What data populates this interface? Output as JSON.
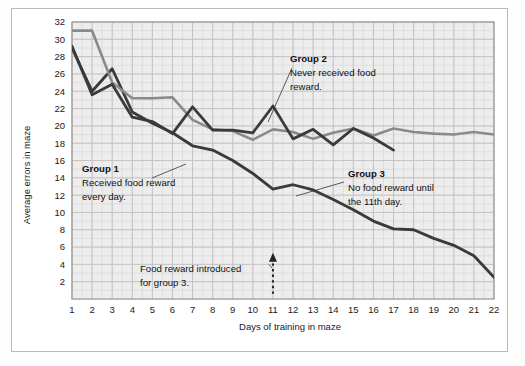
{
  "chart_data": {
    "type": "line",
    "title": "",
    "xlabel": "Days of training in maze",
    "ylabel": "Average errors in maze",
    "xlim": [
      1,
      22
    ],
    "ylim": [
      0,
      32
    ],
    "xticks": [
      1,
      2,
      3,
      4,
      5,
      6,
      7,
      8,
      9,
      10,
      11,
      12,
      13,
      14,
      15,
      16,
      17,
      18,
      19,
      20,
      21,
      22
    ],
    "yticks": [
      2,
      4,
      6,
      8,
      10,
      12,
      14,
      16,
      18,
      20,
      22,
      24,
      26,
      28,
      30,
      32
    ],
    "grid": true,
    "legend_position": "inline-annotations",
    "series": [
      {
        "name": "Group 1",
        "color": "#3a3a3a",
        "x": [
          1,
          2,
          3,
          4,
          5,
          6,
          7,
          8,
          9,
          10,
          11,
          12,
          13,
          14,
          15,
          16,
          17,
          18,
          19,
          20,
          21,
          22
        ],
        "values": [
          29.0,
          24.0,
          26.6,
          21.6,
          20.3,
          19.2,
          17.7,
          17.2,
          16.0,
          14.5,
          12.7,
          13.2,
          12.6,
          11.5,
          10.3,
          9.0,
          8.1,
          8.0,
          7.0,
          6.2,
          5.0,
          2.5
        ]
      },
      {
        "name": "Group 2",
        "color": "#8a8a8a",
        "x": [
          1,
          2,
          3,
          4,
          5,
          6,
          7,
          8,
          9,
          10,
          11,
          12,
          13,
          14,
          15,
          16,
          17,
          18,
          19,
          20,
          21,
          22
        ],
        "values": [
          31.0,
          31.0,
          25.0,
          23.2,
          23.2,
          23.3,
          20.7,
          19.6,
          19.4,
          18.4,
          19.6,
          19.3,
          18.5,
          19.2,
          19.7,
          18.9,
          19.7,
          19.3,
          19.1,
          19.0,
          19.3,
          19.0
        ]
      },
      {
        "name": "Group 3",
        "color": "#3a3a3a",
        "x": [
          1,
          2,
          3,
          4,
          5,
          6,
          7,
          8,
          9,
          10,
          11,
          12,
          13,
          14,
          15,
          16,
          17
        ],
        "values": [
          29.2,
          23.6,
          24.8,
          21.0,
          20.5,
          19.1,
          22.2,
          19.5,
          19.5,
          19.2,
          22.3,
          18.5,
          19.6,
          17.8,
          19.7,
          18.6,
          17.2
        ]
      }
    ],
    "annotations": [
      {
        "id": "group-1",
        "title": "Group 1",
        "body_lines": [
          "Received food reward",
          "every day."
        ],
        "x": 10.0,
        "y": 16.0
      },
      {
        "id": "group-2",
        "title": "Group 2",
        "body_lines": [
          "Never received food",
          "reward."
        ],
        "x": 15.0,
        "y": 29.0
      },
      {
        "id": "group-3",
        "title": "Group 3",
        "body_lines": [
          "No food reward until",
          "the 11th day."
        ],
        "x": 18.0,
        "y": 15.5
      },
      {
        "id": "food-reward-marker",
        "title": "",
        "body_lines": [
          "Food reward introduced",
          "for group 3."
        ],
        "x": 11.0,
        "y": 3.5
      }
    ],
    "marker": {
      "label_line_1": "Food reward introduced",
      "label_line_2": "for group 3.",
      "at_day": 11,
      "style": "dotted-arrow-up"
    },
    "colors": {
      "plot_background": "#ededed",
      "grid_minor": "#d8d8d8",
      "grid_major": "#c4c4c4",
      "axis": "#8a8a8a",
      "series_dark": "#3a3a3a",
      "series_light": "#8a8a8a",
      "text": "#111111",
      "card_background": "#ffffff",
      "card_border": "#b9b9b9"
    }
  }
}
